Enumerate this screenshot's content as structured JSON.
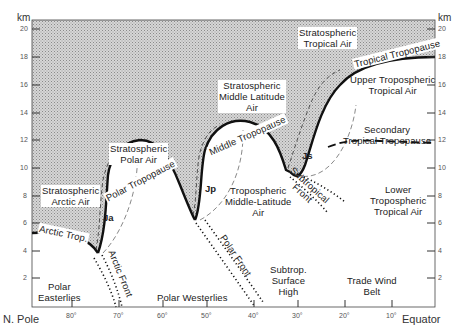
{
  "diagram": {
    "type": "atmospheric cross-section",
    "axes": {
      "y_unit": "km",
      "y_ticks_left": [
        "20",
        "18",
        "16",
        "14",
        "12",
        "10",
        "8",
        "6",
        "4",
        "2"
      ],
      "y_ticks_right": [
        "20",
        "18",
        "16",
        "14",
        "12",
        "10",
        "8",
        "6",
        "4",
        "2"
      ],
      "x_start_label": "N. Pole",
      "x_end_label": "Equator",
      "x_ticks": [
        "80°",
        "70°",
        "60°",
        "50°",
        "40°",
        "30°",
        "20°",
        "10°"
      ]
    },
    "stratosphere_labels": {
      "tropical": [
        "Stratospheric",
        "Tropical Air"
      ],
      "middle_latitude": [
        "Stratospheric",
        "Middle Latitude",
        "Air"
      ],
      "polar": [
        "Stratospheric",
        "Polar Air"
      ],
      "arctic": [
        "Stratospheric",
        "Arctic Air"
      ]
    },
    "tropopause_labels": {
      "tropical": "Tropical Tropopause",
      "middle": "Middle Tropopause",
      "polar": "Polar Tropopause",
      "arctic": "Arctic Trop.",
      "secondary": [
        "Secondary",
        "Tropical Tropopause"
      ]
    },
    "troposphere_labels": {
      "upper_tropical": [
        "Upper Tropospheric",
        "Tropical Air"
      ],
      "lower_tropical": [
        "Lower",
        "Tropospheric",
        "Tropical Air"
      ],
      "middle_latitude": [
        "Tropospheric",
        "Middle-Latitude",
        "Air"
      ]
    },
    "jet_streams": {
      "arctic": "Ja",
      "polar": "Jp",
      "subtropical": "Js"
    },
    "fronts": {
      "arctic": "Arctic Front",
      "polar": "Polar Front",
      "subtropical": [
        "Subtropical",
        "Front"
      ]
    },
    "surface_labels": {
      "polar_easterlies": [
        "Polar",
        "Easterlies"
      ],
      "polar_westerlies": "Polar Westerlies",
      "subtrop_high": [
        "Subtrop.",
        "Surface",
        "High"
      ],
      "trade_wind": [
        "Trade Wind",
        "Belt"
      ]
    },
    "colors": {
      "stratosphere_fill": "#c8c8c8",
      "line": "#111111",
      "background": "#ffffff"
    }
  }
}
